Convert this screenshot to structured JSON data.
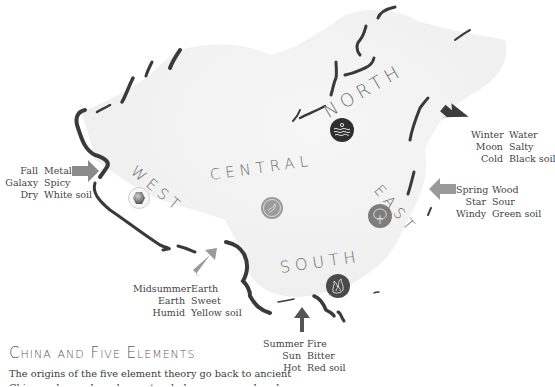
{
  "title": "China and Five Elements",
  "body_text": {
    "line1": "The origins of the five element theory go back to ancient",
    "line2_partial": "China and were based on natural phenomena and cycles"
  },
  "regions": [
    {
      "id": "north",
      "label": "NORTH",
      "emblem": "water-waves-icon",
      "legend": [
        {
          "k": "Winter",
          "v": "Water"
        },
        {
          "k": "Moon",
          "v": "Salty"
        },
        {
          "k": "Cold",
          "v": "Black soil"
        }
      ],
      "arrow_color": "#3c3c3c"
    },
    {
      "id": "west",
      "label": "WEST",
      "emblem": "metal-hexagon-icon",
      "legend": [
        {
          "k": "Fall",
          "v": "Metal"
        },
        {
          "k": "Galaxy",
          "v": "Spicy"
        },
        {
          "k": "Dry",
          "v": "White soil"
        }
      ],
      "arrow_color": "#8a8a8a"
    },
    {
      "id": "central",
      "label": "CENTRAL",
      "emblem": "earth-icon",
      "legend": [
        {
          "k": "Midsummer",
          "v": "Earth"
        },
        {
          "k": "Earth",
          "v": "Sweet"
        },
        {
          "k": "Humid",
          "v": "Yellow soil"
        }
      ],
      "arrow_color": "#9a9a9a"
    },
    {
      "id": "east",
      "label": "EAST",
      "emblem": "tree-wood-icon",
      "legend": [
        {
          "k": "Spring",
          "v": "Wood"
        },
        {
          "k": "Star",
          "v": "Sour"
        },
        {
          "k": "Windy",
          "v": "Green soil"
        }
      ],
      "arrow_color": "#9a9a9a"
    },
    {
      "id": "south",
      "label": "SOUTH",
      "emblem": "fire-flame-icon",
      "legend": [
        {
          "k": "Summer",
          "v": "Fire"
        },
        {
          "k": "Sun",
          "v": "Bitter"
        },
        {
          "k": "Hot",
          "v": "Red soil"
        }
      ],
      "arrow_color": "#555555"
    }
  ],
  "colors": {
    "map_fill": "#f1f1f1",
    "border": "#3a3a3a",
    "label": "#6e6e6e",
    "north_emblem": "#2f2f2f",
    "south_emblem": "#4a4a4a",
    "east_emblem": "#7d7d7d",
    "central_emblem": "#9a9a9a"
  }
}
